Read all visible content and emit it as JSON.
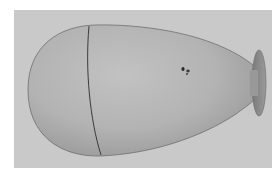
{
  "image": {
    "description": "3D rendered egg/balloon-shaped object with a seam line and a small disc-shaped nozzle on the right, on a gray background",
    "background_color": "#c9c9c9",
    "object_color": "#b4b4b4",
    "seam_color": "#3a3a3a",
    "nozzle_color": "#8c8c8c"
  }
}
